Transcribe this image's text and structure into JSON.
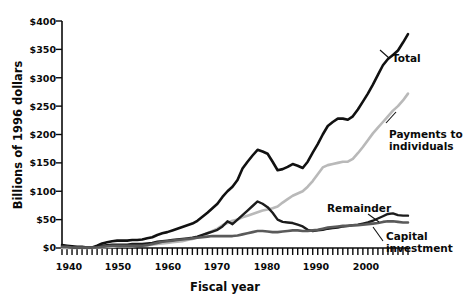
{
  "chart_data": {
    "type": "line",
    "title": "",
    "xlabel": "Fiscal year",
    "ylabel": "Billions of 1996 dollars",
    "xlim": [
      1939,
      2008
    ],
    "ylim": [
      0,
      400
    ],
    "grid": false,
    "legend_position": "inline-annotations",
    "y_ticks": [
      0,
      50,
      100,
      150,
      200,
      250,
      300,
      350,
      400
    ],
    "y_tick_labels": [
      "$0",
      "$50",
      "$100",
      "$150",
      "$200",
      "$250",
      "$300",
      "$350",
      "$400"
    ],
    "x_ticks": [
      1940,
      1950,
      1960,
      1970,
      1980,
      1990,
      2000
    ],
    "x_tick_labels": [
      "1940",
      "1950",
      "1960",
      "1970",
      "1980",
      "1990",
      "2000"
    ],
    "x_minor_tick_interval": 1,
    "x": [
      1939,
      1940,
      1941,
      1942,
      1943,
      1944,
      1945,
      1946,
      1947,
      1948,
      1949,
      1950,
      1951,
      1952,
      1953,
      1954,
      1955,
      1956,
      1957,
      1958,
      1959,
      1960,
      1961,
      1962,
      1963,
      1964,
      1965,
      1966,
      1967,
      1968,
      1969,
      1970,
      1971,
      1972,
      1973,
      1974,
      1975,
      1976,
      1977,
      1978,
      1979,
      1980,
      1981,
      1982,
      1983,
      1984,
      1985,
      1986,
      1987,
      1988,
      1989,
      1990,
      1991,
      1992,
      1993,
      1994,
      1995,
      1996,
      1997,
      1998,
      1999,
      2000,
      2001,
      2002,
      2003,
      2004,
      2005,
      2006,
      2007,
      2008
    ],
    "series": [
      {
        "name": "Total",
        "color": "#111111",
        "width": 2.6,
        "label": "Total",
        "values": [
          5,
          4,
          3,
          2,
          2,
          1,
          1,
          4,
          8,
          10,
          12,
          13,
          13,
          13,
          14,
          14,
          15,
          17,
          19,
          23,
          26,
          28,
          31,
          34,
          37,
          40,
          43,
          48,
          55,
          62,
          70,
          78,
          90,
          100,
          108,
          120,
          140,
          152,
          163,
          173,
          170,
          166,
          152,
          137,
          139,
          143,
          148,
          145,
          141,
          152,
          168,
          183,
          200,
          215,
          222,
          228,
          228,
          226,
          232,
          244,
          258,
          272,
          288,
          305,
          322,
          333,
          340,
          348,
          362,
          377
        ]
      },
      {
        "name": "Payments to individuals",
        "color": "#b9b9b9",
        "width": 2.6,
        "label": "Payments to individuals",
        "values": [
          0,
          0,
          0,
          0,
          0,
          0,
          0,
          1,
          1,
          2,
          2,
          3,
          3,
          3,
          3,
          4,
          4,
          5,
          6,
          7,
          8,
          9,
          10,
          11,
          12,
          14,
          16,
          19,
          22,
          26,
          30,
          34,
          40,
          44,
          48,
          50,
          54,
          57,
          60,
          63,
          66,
          68,
          70,
          73,
          80,
          86,
          92,
          96,
          100,
          108,
          118,
          130,
          142,
          146,
          148,
          150,
          152,
          152,
          157,
          167,
          178,
          190,
          202,
          212,
          222,
          232,
          242,
          250,
          260,
          272
        ]
      },
      {
        "name": "Remainder",
        "color": "#1c1c1c",
        "width": 2.4,
        "label": "Remainder",
        "values": [
          2,
          2,
          1,
          1,
          1,
          1,
          1,
          2,
          4,
          5,
          6,
          6,
          6,
          6,
          7,
          7,
          7,
          8,
          9,
          11,
          12,
          13,
          14,
          15,
          16,
          17,
          18,
          20,
          23,
          26,
          29,
          32,
          38,
          47,
          42,
          50,
          58,
          66,
          74,
          82,
          78,
          72,
          62,
          50,
          46,
          45,
          44,
          41,
          38,
          32,
          30,
          31,
          32,
          34,
          35,
          36,
          38,
          39,
          40,
          41,
          43,
          45,
          48,
          52,
          56,
          60,
          61,
          58,
          57,
          57
        ]
      },
      {
        "name": "Capital investment",
        "color": "#5a5a5a",
        "width": 2.6,
        "label": "Capital investment",
        "values": [
          2,
          2,
          1,
          1,
          1,
          1,
          1,
          1,
          2,
          3,
          4,
          4,
          4,
          4,
          4,
          4,
          4,
          5,
          7,
          9,
          11,
          12,
          13,
          14,
          15,
          16,
          17,
          18,
          19,
          20,
          21,
          21,
          21,
          21,
          21,
          22,
          24,
          26,
          28,
          30,
          30,
          29,
          28,
          28,
          29,
          30,
          31,
          31,
          30,
          30,
          31,
          32,
          34,
          36,
          37,
          38,
          39,
          39,
          40,
          40,
          41,
          42,
          43,
          44,
          46,
          47,
          47,
          46,
          45,
          45
        ]
      }
    ],
    "annotations": [
      {
        "text": "Total",
        "series": "Total"
      },
      {
        "text": "Payments to individuals",
        "series": "Payments to individuals"
      },
      {
        "text": "Remainder",
        "series": "Remainder"
      },
      {
        "text": "Capital investment",
        "series": "Capital investment"
      }
    ]
  },
  "labels": {
    "y_axis_title": "Billions of 1996 dollars",
    "x_axis_title": "Fiscal year",
    "total": "Total",
    "payments_line1": "Payments to",
    "payments_line2": "individuals",
    "remainder": "Remainder",
    "capital_line1": "Capital",
    "capital_line2": "investment",
    "y0": "$0",
    "y50": "$50",
    "y100": "$100",
    "y150": "$150",
    "y200": "$200",
    "y250": "$250",
    "y300": "$300",
    "y350": "$350",
    "y400": "$400",
    "x1940": "1940",
    "x1950": "1950",
    "x1960": "1960",
    "x1970": "1970",
    "x1980": "1980",
    "x1990": "1990",
    "x2000": "2000"
  }
}
